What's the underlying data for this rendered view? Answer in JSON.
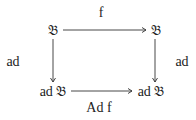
{
  "diagram": {
    "type": "commutative-diagram",
    "nodes": {
      "top_left": "𝔅",
      "top_right": "𝔅",
      "bottom_left": "ad 𝔅",
      "bottom_right": "ad 𝔅"
    },
    "arrows": {
      "top": "f",
      "left": "ad",
      "right": "ad",
      "bottom": "Ad f"
    },
    "colors": {
      "ink": "#222222",
      "background": "#ffffff"
    }
  }
}
